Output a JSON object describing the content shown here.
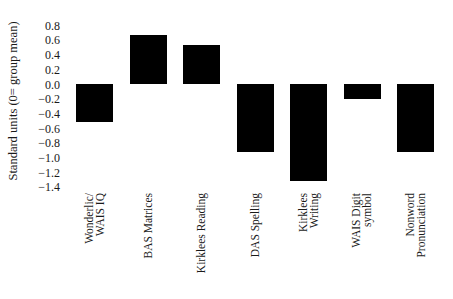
{
  "chart_data": {
    "type": "bar",
    "title": "",
    "xlabel": "",
    "ylabel": "Standard units (0= group mean)",
    "ylim": [
      -1.4,
      0.8
    ],
    "yticks": [
      "0.8",
      "0.6",
      "0.4",
      "0.2",
      "0.0",
      "−0.2",
      "−0.4",
      "−0.6",
      "−0.8",
      "−1.0",
      "−1.2",
      "−1.4"
    ],
    "ytick_values": [
      0.8,
      0.6,
      0.4,
      0.2,
      0.0,
      -0.2,
      -0.4,
      -0.6,
      -0.8,
      -1.0,
      -1.2,
      -1.4
    ],
    "categories": [
      "Wonderlic/ WAIS IQ",
      "BAS Matrices",
      "Kirklees Reading",
      "DAS Spelling",
      "Kirklees Writing",
      "WAIS Digit symbol",
      "Nonword Pronunciation"
    ],
    "category_lines": [
      [
        "Wonderlic/",
        "WAIS IQ"
      ],
      [
        "BAS Matrices"
      ],
      [
        "Kirklees Reading"
      ],
      [
        "DAS Spelling"
      ],
      [
        "Kirklees",
        "Writing"
      ],
      [
        "WAIS Digit",
        "symbol"
      ],
      [
        "Nonword",
        "Pronunciation"
      ]
    ],
    "values": [
      -0.52,
      0.67,
      0.53,
      -0.93,
      -1.32,
      -0.2,
      -0.93
    ],
    "bar_color": "#000000",
    "grid": false,
    "legend": null
  }
}
